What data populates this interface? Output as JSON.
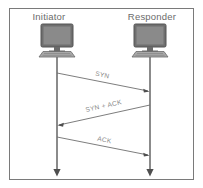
{
  "diagram": {
    "frame": {
      "border_color": "#7a7a7a",
      "background": "#ffffff"
    },
    "actors": [
      {
        "id": "initiator",
        "label": "Initiator",
        "icon": "computer-monitor-icon",
        "lifeline_x": 57
      },
      {
        "id": "responder",
        "label": "Responder",
        "icon": "computer-monitor-icon",
        "lifeline_x": 150
      }
    ],
    "messages": [
      {
        "label": "SYN",
        "from": "initiator",
        "to": "responder",
        "direction": "right",
        "start_y": 73,
        "end_y": 91
      },
      {
        "label": "SYN + ACK",
        "from": "responder",
        "to": "initiator",
        "direction": "left",
        "start_y": 105,
        "end_y": 125
      },
      {
        "label": "ACK",
        "from": "initiator",
        "to": "responder",
        "direction": "right",
        "start_y": 137,
        "end_y": 155
      }
    ],
    "colors": {
      "line": "#6e6e6e",
      "label_text": "#6b6b6b",
      "message_text": "#8a8a8a",
      "monitor_screen": "#7e7e7e",
      "monitor_frame": "#5f5f5f",
      "keyboard": "#9a9a9a"
    }
  }
}
